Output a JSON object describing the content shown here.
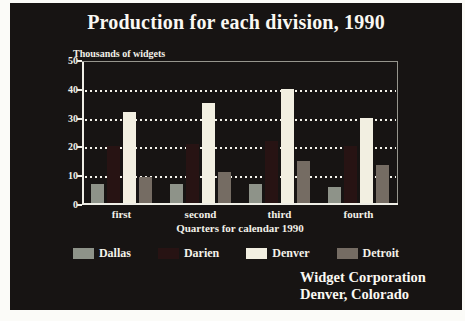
{
  "slide": {
    "title": "Production for each division, 1990",
    "footer_line1": "Widget Corporation",
    "footer_line2": "Denver, Colorado"
  },
  "chart_data": {
    "type": "bar",
    "title": "Production for each division, 1990",
    "ylabel": "Thousands of widgets",
    "xlabel": "Quarters for calendar 1990",
    "categories": [
      "first",
      "second",
      "third",
      "fourth"
    ],
    "series": [
      {
        "name": "Dallas",
        "color": "#8e9389",
        "values": [
          7,
          7,
          7,
          6
        ]
      },
      {
        "name": "Darien",
        "color": "#271313",
        "values": [
          20,
          21,
          22,
          20
        ]
      },
      {
        "name": "Denver",
        "color": "#f2efe1",
        "values": [
          32,
          35,
          40,
          30
        ]
      },
      {
        "name": "Detroit",
        "color": "#756c63",
        "values": [
          9.5,
          11,
          15,
          13.5
        ]
      }
    ],
    "ylim": [
      0,
      50
    ],
    "yticks": [
      0,
      10,
      20,
      30,
      40,
      50
    ],
    "grid": "horizontal dotted at 10,20,30,40",
    "legend_position": "bottom",
    "colors": {
      "slide_background": "#171413",
      "text": "#f2f0e8",
      "axis": "#efeee6",
      "frame": "#96958d"
    }
  }
}
